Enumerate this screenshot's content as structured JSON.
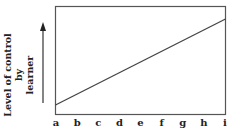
{
  "chart_data": {
    "type": "line",
    "title": "",
    "xlabel": "",
    "ylabel": "Level of control by learner",
    "categories": [
      "a",
      "b",
      "c",
      "d",
      "e",
      "f",
      "g",
      "h",
      "i"
    ],
    "series": [
      {
        "name": "Level of control by learner",
        "values": [
          0.08,
          0.18,
          0.28,
          0.38,
          0.48,
          0.57,
          0.67,
          0.77,
          0.87
        ]
      }
    ],
    "ylim": [
      0,
      1
    ],
    "grid": false,
    "legend": "none",
    "y_axis_arrow": true
  },
  "labels": {
    "ylabel_line1": "Level of control by",
    "ylabel_line2": "learner",
    "x_ticks": [
      "a",
      "b",
      "c",
      "d",
      "e",
      "f",
      "g",
      "h",
      "i"
    ]
  }
}
